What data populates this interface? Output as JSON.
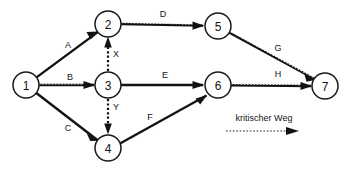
{
  "diagram": {
    "type": "activity-on-arrow-network",
    "nodes": [
      {
        "id": "n1",
        "label": "1",
        "cx": 26,
        "cy": 85,
        "r": 13
      },
      {
        "id": "n2",
        "label": "2",
        "cx": 108,
        "cy": 24,
        "r": 13
      },
      {
        "id": "n3",
        "label": "3",
        "cx": 108,
        "cy": 85,
        "r": 13
      },
      {
        "id": "n4",
        "label": "4",
        "cx": 108,
        "cy": 148,
        "r": 13
      },
      {
        "id": "n5",
        "label": "5",
        "cx": 218,
        "cy": 26,
        "r": 13
      },
      {
        "id": "n6",
        "label": "6",
        "cx": 218,
        "cy": 85,
        "r": 13
      },
      {
        "id": "n7",
        "label": "7",
        "cx": 325,
        "cy": 86,
        "r": 13
      }
    ],
    "edges": [
      {
        "id": "eA",
        "label": "A",
        "from": "1",
        "to": "2",
        "style": "solid",
        "critical": false,
        "label_x": 68,
        "label_y": 45
      },
      {
        "id": "eB",
        "label": "B",
        "from": "1",
        "to": "3",
        "style": "solid",
        "critical": true,
        "label_x": 70,
        "label_y": 77
      },
      {
        "id": "eC",
        "label": "C",
        "from": "1",
        "to": "4",
        "style": "solid",
        "critical": false,
        "label_x": 68,
        "label_y": 128
      },
      {
        "id": "eD",
        "label": "D",
        "from": "2",
        "to": "5",
        "style": "solid",
        "critical": true,
        "label_x": 163,
        "label_y": 14
      },
      {
        "id": "eE",
        "label": "E",
        "from": "3",
        "to": "6",
        "style": "solid",
        "critical": false,
        "label_x": 165,
        "label_y": 75
      },
      {
        "id": "eF",
        "label": "F",
        "from": "4",
        "to": "6",
        "style": "solid",
        "critical": true,
        "label_x": 150,
        "label_y": 117
      },
      {
        "id": "eG",
        "label": "G",
        "from": "5",
        "to": "7",
        "style": "solid",
        "critical": true,
        "label_x": 278,
        "label_y": 48
      },
      {
        "id": "eH",
        "label": "H",
        "from": "6",
        "to": "7",
        "style": "solid",
        "critical": true,
        "label_x": 278,
        "label_y": 74
      },
      {
        "id": "eX",
        "label": "X",
        "from": "3",
        "to": "2",
        "style": "dashed",
        "critical": true,
        "label_x": 115,
        "label_y": 54
      },
      {
        "id": "eY",
        "label": "Y",
        "from": "3",
        "to": "4",
        "style": "dashed",
        "critical": true,
        "label_x": 115,
        "label_y": 107
      }
    ],
    "legend": {
      "text": "kritischer Weg",
      "text_x": 264,
      "text_y": 118,
      "line_x1": 226,
      "line_x2": 298,
      "line_y": 131,
      "style": "dotted-arrow"
    },
    "colors": {
      "stroke": "#121212",
      "node_fill": "#ffffff",
      "background": "#ffffff",
      "critical_overlay": "#2a2a2a"
    }
  }
}
